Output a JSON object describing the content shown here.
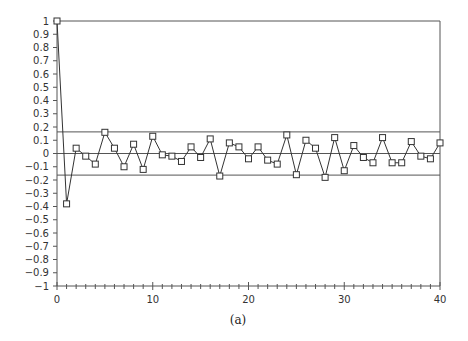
{
  "chart_data": {
    "type": "line",
    "title": "",
    "caption": "(a)",
    "xlabel": "",
    "ylabel": "",
    "xlim": [
      0,
      40
    ],
    "ylim": [
      -1,
      1
    ],
    "x_ticks": [
      0,
      10,
      20,
      30,
      40
    ],
    "x_tick_labels": [
      "0",
      "10",
      "20",
      "30",
      "40"
    ],
    "x_minor_tick_step": 1,
    "y_ticks": [
      1,
      0.9,
      0.8,
      0.7,
      0.6,
      0.5,
      0.4,
      0.3,
      0.2,
      0.1,
      0,
      -0.1,
      -0.2,
      -0.3,
      -0.4,
      -0.5,
      -0.6,
      -0.7,
      -0.8,
      -0.9,
      -1
    ],
    "y_tick_labels": [
      "1",
      "0.9",
      "0.8",
      "0.7",
      "0.6",
      "0.5",
      "0.4",
      "0.3",
      "0.2",
      "0.1",
      "0",
      "−0.1",
      "−0.2",
      "−0.3",
      "−0.4",
      "−0.5",
      "−0.6",
      "−0.7",
      "−0.8",
      "−0.9",
      "−1"
    ],
    "grid": false,
    "legend": null,
    "marker": "open-square",
    "reference_lines": [
      {
        "name": "upper-confidence-band",
        "y": 0.163
      },
      {
        "name": "zero-line",
        "y": 0
      },
      {
        "name": "lower-confidence-band",
        "y": -0.163
      }
    ],
    "x": [
      0,
      1,
      2,
      3,
      4,
      5,
      6,
      7,
      8,
      9,
      10,
      11,
      12,
      13,
      14,
      15,
      16,
      17,
      18,
      19,
      20,
      21,
      22,
      23,
      24,
      25,
      26,
      27,
      28,
      29,
      30,
      31,
      32,
      33,
      34,
      35,
      36,
      37,
      38,
      39,
      40
    ],
    "series": [
      {
        "name": "autocorrelation",
        "values": [
          1.0,
          -0.38,
          0.04,
          -0.02,
          -0.08,
          0.16,
          0.04,
          -0.1,
          0.07,
          -0.12,
          0.13,
          -0.01,
          -0.02,
          -0.06,
          0.05,
          -0.03,
          0.11,
          -0.17,
          0.08,
          0.05,
          -0.04,
          0.05,
          -0.05,
          -0.08,
          0.14,
          -0.16,
          0.1,
          0.04,
          -0.18,
          0.12,
          -0.13,
          0.06,
          -0.03,
          -0.07,
          0.12,
          -0.07,
          -0.07,
          0.09,
          -0.02,
          -0.04,
          0.08
        ]
      }
    ],
    "colors": {
      "line": "#333333",
      "frame": "#555555",
      "reference": "#555555",
      "text": "#333333"
    }
  }
}
